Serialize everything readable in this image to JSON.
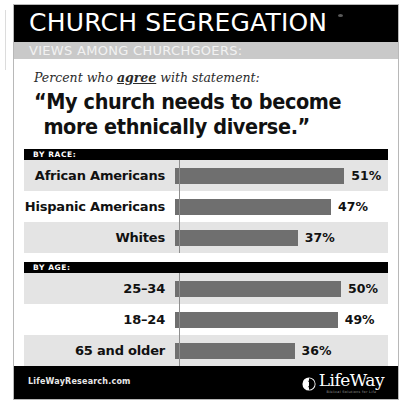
{
  "header": {
    "title": "CHURCH SEGREGATION",
    "subtitle": "VIEWS AMONG CHURCHGOERS:"
  },
  "statement": {
    "kicker_before": "Percent who ",
    "kicker_emphasis": "agree",
    "kicker_after": " with statement:",
    "quote_line1": "“My church needs to become",
    "quote_line2": "more ethnically diverse.”"
  },
  "sections": [
    {
      "band_label": "BY RACE:",
      "rows": [
        {
          "label": "African Americans",
          "value": 51,
          "value_label": "51%"
        },
        {
          "label": "Hispanic Americans",
          "value": 47,
          "value_label": "47%"
        },
        {
          "label": "Whites",
          "value": 37,
          "value_label": "37%"
        }
      ]
    },
    {
      "band_label": "BY AGE:",
      "rows": [
        {
          "label": "25–34",
          "value": 50,
          "value_label": "50%"
        },
        {
          "label": "18–24",
          "value": 49,
          "value_label": "49%"
        },
        {
          "label": "65 and older",
          "value": 36,
          "value_label": "36%"
        }
      ]
    }
  ],
  "footer": {
    "url": "LifeWayResearch.com",
    "logo_text": "LifeWay",
    "logo_tagline": "Biblical Solutions for Life",
    "logo_icon": "lifeway-circle-icon"
  },
  "colors": {
    "band_black": "#000000",
    "subtitle_gray": "#c9c9c9",
    "bar_gray": "#6f6f6f",
    "row_shade": "#e4e4e4",
    "axis_gray": "#8f8f8f"
  },
  "chart_data": {
    "type": "bar",
    "title": "CHURCH SEGREGATION",
    "subtitle": "VIEWS AMONG CHURCHGOERS:",
    "annotation": "Percent who agree with statement: “My church needs to become more ethnically diverse.”",
    "orientation": "horizontal",
    "xlabel": "",
    "ylabel": "",
    "xlim": [
      0,
      60
    ],
    "grid": false,
    "legend": "none",
    "groups": [
      {
        "name": "BY RACE:",
        "categories": [
          "African Americans",
          "Hispanic Americans",
          "Whites"
        ],
        "values": [
          51,
          47,
          37
        ]
      },
      {
        "name": "BY AGE:",
        "categories": [
          "25–34",
          "18–24",
          "65 and older"
        ],
        "values": [
          50,
          49,
          36
        ]
      }
    ],
    "categories": [
      "African Americans",
      "Hispanic Americans",
      "Whites",
      "25–34",
      "18–24",
      "65 and older"
    ],
    "values": [
      51,
      47,
      37,
      50,
      49,
      36
    ],
    "value_labels": [
      "51%",
      "47%",
      "37%",
      "50%",
      "49%",
      "36%"
    ],
    "source": "LifeWayResearch.com"
  }
}
